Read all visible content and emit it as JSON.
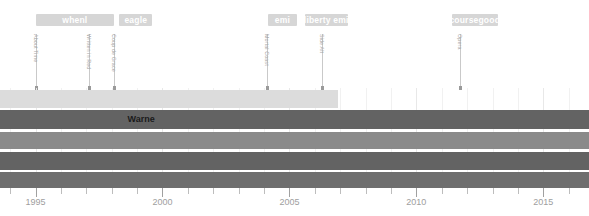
{
  "chart_data": {
    "type": "table",
    "title": "",
    "xlabel": "",
    "ylabel": "",
    "xlim": [
      1993.6,
      2016.8
    ],
    "grid": true,
    "axis": {
      "tick_labels": [
        "1995",
        "2000",
        "2005",
        "2010",
        "2015"
      ],
      "tick_values": [
        1995,
        2000,
        2005,
        2010,
        2015
      ]
    },
    "group_bands": [
      {
        "label": "whenl",
        "start": 1995.0,
        "end": 1998.1
      },
      {
        "label": "eagle",
        "start": 1998.3,
        "end": 1999.6
      },
      {
        "label": "emi",
        "start": 2004.15,
        "end": 2005.3
      },
      {
        "label": "liberty emi",
        "start": 2005.6,
        "end": 2007.3
      },
      {
        "label": "coursegood",
        "start": 2011.4,
        "end": 2013.2
      }
    ],
    "events": [
      {
        "label": "About Time",
        "x": 1995.0
      },
      {
        "label": "Written in Red",
        "x": 1997.1
      },
      {
        "label": "Coup de Grace",
        "x": 1998.1
      },
      {
        "label": "Mortal Coast",
        "x": 2004.1
      },
      {
        "label": "Side Alt",
        "x": 2006.3
      },
      {
        "label": "Opera",
        "x": 2011.7
      }
    ],
    "rows": [
      {
        "label": "",
        "start": 1993.6,
        "end": 2006.9,
        "color": "#dcdcdc",
        "highlight": false
      },
      {
        "label": "Warne",
        "start": 1993.6,
        "end": 2016.8,
        "color": "#636363",
        "highlight": true,
        "label_x": 2000.0
      },
      {
        "label": "",
        "start": 1993.6,
        "end": 2016.8,
        "color": "#8a8a8a",
        "highlight": false
      },
      {
        "label": "",
        "start": 1993.6,
        "end": 2016.8,
        "color": "#636363",
        "highlight": false
      },
      {
        "label": "",
        "start": 1993.6,
        "end": 2016.8,
        "color": "#6e6e6e",
        "highlight": false
      }
    ],
    "colors": {
      "band": "#d6d6d6",
      "band_text": "#ffffff",
      "stem": "#c9c9c9",
      "event_text": "#a8a8a8",
      "axis_text": "#9e9e9e",
      "highlight_text": "#1a1a1a",
      "background": "#ffffff"
    }
  }
}
